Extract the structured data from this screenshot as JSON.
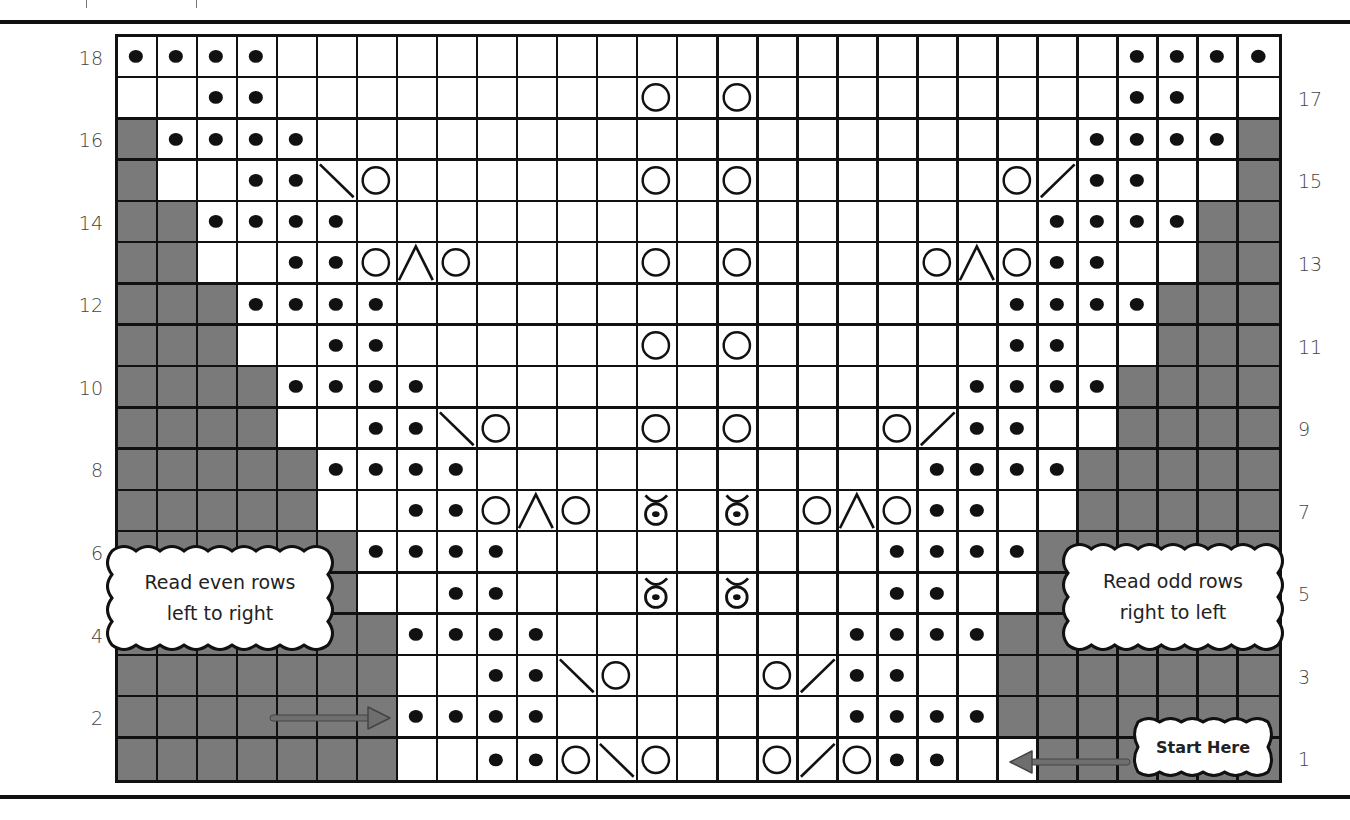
{
  "chart": {
    "columns": 29,
    "row_count": 18,
    "colors": {
      "no_stitch": "#7a7a7a",
      "grid_line": "#111111",
      "background": "#ffffff",
      "arrow": "#6e6e6e"
    },
    "legend_codes": {
      "g": "no-stitch (grey)",
      "w": "knit (empty)",
      "d": "purl (dot)",
      "o": "yarn over (circle)",
      "l": "left-slanting decrease (\\)",
      "r": "right-slanting decrease (/)",
      "a": "double decrease (^)",
      "b": "bobble / twist symbol"
    },
    "rows": [
      {
        "num": 18,
        "label_side": "left",
        "cells": "ddddwwwwwwwwwwwwwwwwwwwwwdddd"
      },
      {
        "num": 17,
        "label_side": "right",
        "cells": "wwddwwwwwwwwwowowwwwwwwwwddww"
      },
      {
        "num": 16,
        "label_side": "left",
        "cells": "gddddwwwwwwwwwwwwwwwwwwwddddg"
      },
      {
        "num": 15,
        "label_side": "right",
        "cells": "gwwddlowwwwwwowowwwwwworddwwg"
      },
      {
        "num": 14,
        "label_side": "left",
        "cells": "ggddddwwwwwwwwwwwwwwwwwddddgg"
      },
      {
        "num": 13,
        "label_side": "right",
        "cells": "ggwwddoaowwwwowowwwwoaoddwwgg"
      },
      {
        "num": 12,
        "label_side": "left",
        "cells": "gggddddwwwwwwwwwwwwwwwddddggg"
      },
      {
        "num": 11,
        "label_side": "right",
        "cells": "gggwwddwwwwwwowowwwwwwddwwggg"
      },
      {
        "num": 10,
        "label_side": "left",
        "cells": "ggggddddwwwwwwwwwwwwwddddgggg"
      },
      {
        "num": 9,
        "label_side": "right",
        "cells": "ggggwwddlowwwowowwworddwwgggg"
      },
      {
        "num": 8,
        "label_side": "left",
        "cells": "gggggddddwwwwwwwwwwwddddggggg"
      },
      {
        "num": 7,
        "label_side": "right",
        "cells": "gggggwwddoaowbwbwoaoddwwggggg"
      },
      {
        "num": 6,
        "label_side": "left",
        "cells": "ggggggddddwwwwwwwwwddddgggggg"
      },
      {
        "num": 5,
        "label_side": "right",
        "cells": "ggggggwwddwwwbwbwwwddwwgggggg"
      },
      {
        "num": 4,
        "label_side": "left",
        "cells": "gggggggddddwwwwwwwddddggggggg"
      },
      {
        "num": 3,
        "label_side": "right",
        "cells": "gggggggwwddlowwworddwwggggggg"
      },
      {
        "num": 2,
        "label_side": "left",
        "cells": "gggggggddddwwwwwwwddddggggggg"
      },
      {
        "num": 1,
        "label_side": "right",
        "cells": "gggggggwwddolowworoddwwggggggg"
      }
    ]
  },
  "callouts": {
    "even": {
      "line1": "Read even rows",
      "line2": "left to right"
    },
    "odd": {
      "line1": "Read odd rows",
      "line2": "right to left"
    },
    "start": {
      "label": "Start Here"
    }
  },
  "arrows": {
    "even_arrow": {
      "direction": "right"
    },
    "start_arrow": {
      "direction": "left"
    }
  }
}
